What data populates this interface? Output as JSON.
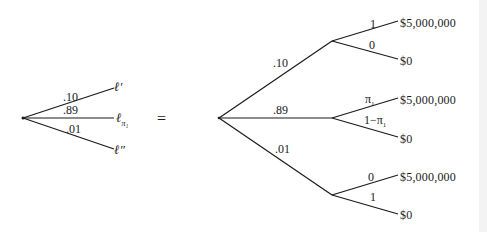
{
  "left_tree": {
    "branches": [
      {
        "prob": ".10",
        "lottery": "ℓ′"
      },
      {
        "prob": ".89",
        "lottery_base": "ℓ",
        "lottery_sub": "π₁"
      },
      {
        "prob": ".01",
        "lottery": "ℓ″"
      }
    ]
  },
  "equals": "=",
  "right_tree": {
    "branches": [
      {
        "prob": ".10",
        "outcomes": [
          {
            "prob": "1",
            "payoff": "$5,000,000"
          },
          {
            "prob": "0",
            "payoff": "$0"
          }
        ]
      },
      {
        "prob": ".89",
        "outcomes": [
          {
            "prob_base": "π",
            "prob_sub": "1",
            "payoff": "$5,000,000"
          },
          {
            "prob_base": "1−π",
            "prob_sub": "1",
            "payoff": "$0"
          }
        ]
      },
      {
        "prob": ".01",
        "outcomes": [
          {
            "prob": "0",
            "payoff": "$5,000,000"
          },
          {
            "prob": "1",
            "payoff": "$0"
          }
        ]
      }
    ]
  },
  "colors": {
    "line": "#1a1a1a",
    "background": "#ffffff"
  }
}
